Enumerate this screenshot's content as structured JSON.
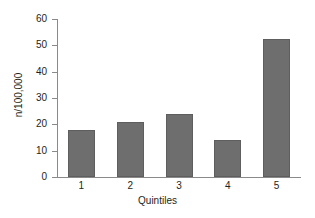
{
  "chart_data": {
    "type": "bar",
    "title": "",
    "xlabel": "Quintiles",
    "ylabel": "n/100,000",
    "categories": [
      "1",
      "2",
      "3",
      "4",
      "5"
    ],
    "values": [
      18,
      21,
      24,
      14,
      52.5
    ],
    "ylim": [
      0,
      60
    ],
    "yticks": [
      "0",
      "10",
      "20",
      "30",
      "40",
      "50",
      "60"
    ],
    "ytick_values": [
      0,
      10,
      20,
      30,
      40,
      50,
      60
    ],
    "grid": false,
    "legend": "none",
    "series": [
      {
        "name": "n/100,000",
        "values": [
          18,
          21,
          24,
          14,
          52.5
        ]
      }
    ],
    "colors": {
      "bar_fill": "#6e6e6e",
      "bar_stroke": "#5e5e5e",
      "axis": "#8a8a8a",
      "text": "#231f20",
      "background": "#ffffff"
    }
  }
}
